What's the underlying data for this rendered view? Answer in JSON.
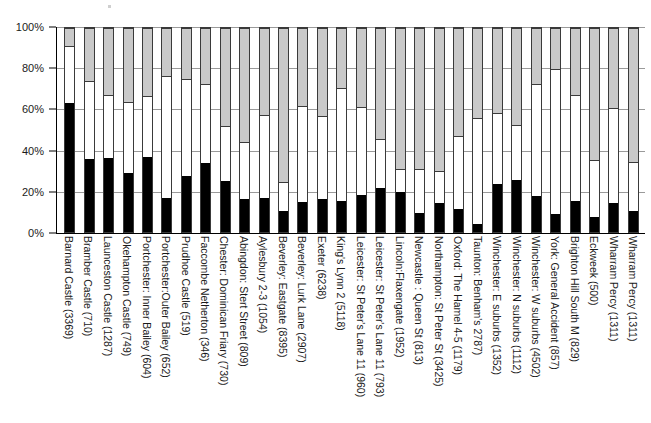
{
  "chart_data": {
    "type": "bar",
    "subtype": "stacked-percentage",
    "title": "",
    "subtitle": "",
    "xlabel": "",
    "ylabel": "",
    "ylim": [
      0,
      100
    ],
    "yticks": [
      "0%",
      "20%",
      "40%",
      "60%",
      "80%",
      "100%"
    ],
    "ytick_values": [
      0,
      20,
      40,
      60,
      80,
      100
    ],
    "grid": true,
    "legend": "none",
    "series": [
      {
        "name": "segment-1-black",
        "color": "#000000",
        "values": [
          63,
          36,
          36.5,
          29,
          37,
          16.5,
          27.5,
          34,
          25,
          16,
          16.5,
          10.5,
          14.5,
          16,
          15,
          18,
          21.5,
          19.5,
          9.5,
          14,
          11.5,
          4,
          23.5,
          25.5,
          17.5,
          9,
          15,
          7.5,
          14,
          10.5
        ]
      },
      {
        "name": "segment-2-white",
        "color": "#ffffff",
        "values": [
          28,
          38,
          30.5,
          34.5,
          29.5,
          60,
          47.5,
          38.5,
          27,
          28,
          41,
          14,
          47.5,
          41,
          55.5,
          43.5,
          24,
          11.5,
          21.5,
          16,
          35.5,
          52,
          35,
          27,
          55,
          71,
          52,
          28,
          47,
          24
        ]
      },
      {
        "name": "segment-3-gray",
        "color": "#c9c9c9",
        "values": [
          9,
          26,
          33,
          36.5,
          33.5,
          23.5,
          25,
          27.5,
          48,
          56,
          42.5,
          75.5,
          38,
          43,
          29.5,
          38.5,
          54.5,
          69,
          69,
          70,
          53,
          44,
          41.5,
          47.5,
          27.5,
          20,
          33,
          64.5,
          39,
          65.5
        ]
      }
    ],
    "categories": [
      "Barnard Castle (3369)",
      "Bramber Castle (710)",
      "Launceston Castle (1287)",
      "Okehampton Castle (749)",
      "Portchester: Inner Bailey (604)",
      "Portchester:Outer Bailey (652)",
      "Prudhoe Castle (519)",
      "Faccombe Netherton (346)",
      "Chester: Dominican Friary (730)",
      "Abingdon: Stert Street (809)",
      "Aylesbury 2-3 (1054)",
      "Beverley: Eastgate (8395)",
      "Beverley: Lurk Lane (2907)",
      "Exeter (6238)",
      "King's Lynn 2 (5118)",
      "Leicester: St Peter's Lane 11 (960)",
      "Leicester: St Peter's Lane 11 (793)",
      "Lincoln:Flaxengate (1952)",
      "Newcastle : Queen St (813)",
      "Northampton: St Peter St (3425)",
      "Oxford: The Hamel 4-5 (1179)",
      "Taunton: Benham's 2787)",
      "Winchester: E suburbs (1352)",
      "Winchester: N suburbs (1112)",
      "Winchester: W suburbs (4502)",
      "York: General Accident (857)",
      "Brighton Hill South M (829)",
      "Eckweek (500)",
      "Wharram Percy (1311)",
      "Wharram Percy (1311)"
    ]
  },
  "axis": {
    "y_ticks": [
      "0%",
      "20%",
      "40%",
      "60%",
      "80%",
      "100%"
    ]
  },
  "x_labels": [
    "Barnard Castle (3369)",
    "Bramber Castle (710)",
    "Launceston Castle (1287)",
    "Okehampton Castle (749)",
    "Portchester: Inner Bailey (604)",
    "Portchester:Outer Bailey (652)",
    "Prudhoe Castle (519)",
    "Faccombe Netherton (346)",
    "Chester: Dominican Friary (730)",
    "Abingdon: Stert Street (809)",
    "Aylesbury 2-3 (1054)",
    "Beverley: Eastgate (8395)",
    "Beverley: Lurk Lane (2907)",
    "Exeter (6238)",
    "King's Lynn 2 (5118)",
    "Leicester: St Peter's Lane 11 (960)",
    "Leicester: St Peter's Lane 11 (793)",
    "Lincoln:Flaxengate (1952)",
    "Newcastle : Queen St (813)",
    "Northampton: St Peter St (3425)",
    "Oxford: The Hamel 4-5 (1179)",
    "Taunton: Benham's 2787)",
    "Winchester: E suburbs (1352)",
    "Winchester: N suburbs (1112)",
    "Winchester: W suburbs (4502)",
    "York: General Accident (857)",
    "Brighton Hill South M (829)",
    "Eckweek (500)",
    "Wharram Percy (1311)",
    "Wharram Percy (1311)"
  ]
}
